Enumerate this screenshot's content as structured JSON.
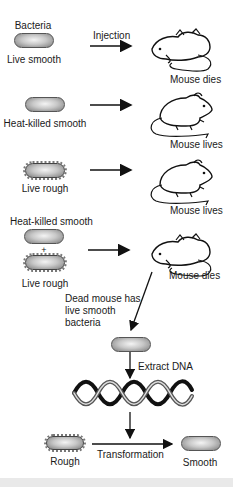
{
  "diagram": {
    "title_label": "Bacteria",
    "experiments": [
      {
        "bacteria_label": "Live smooth",
        "arrow_label": "Injection",
        "outcome": "Mouse dies",
        "bacteria_type": "smooth"
      },
      {
        "bacteria_label": "Heat-killed smooth",
        "arrow_label": "",
        "outcome": "Mouse lives",
        "bacteria_type": "smooth"
      },
      {
        "bacteria_label": "Live rough",
        "arrow_label": "",
        "outcome": "Mouse lives",
        "bacteria_type": "rough"
      },
      {
        "bacteria_label_top": "Heat-killed smooth",
        "plus": "+",
        "bacteria_label_bottom": "Live rough",
        "outcome": "Mouse dies",
        "bacteria_type": "mixed"
      }
    ],
    "dead_mouse_note": "Dead mouse has live smooth bacteria",
    "extract_label": "Extract DNA",
    "transformation": {
      "from_label": "Rough",
      "arrow_label": "Transformation",
      "to_label": "Smooth"
    }
  },
  "colors": {
    "stroke": "#111111",
    "bacteria_light": "#f4f4f4",
    "bacteria_dark": "#7a7a7a",
    "footer": "#e9e9e9"
  }
}
